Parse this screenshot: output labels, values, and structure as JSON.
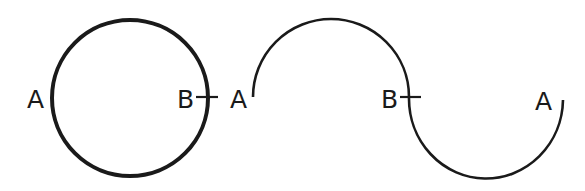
{
  "diagram": {
    "stroke_color": "#1a1a1a",
    "background": "#ffffff",
    "left_figure": {
      "shape": "circle",
      "labels": {
        "left_point": "A",
        "right_point": "B"
      },
      "tick_at": "B"
    },
    "right_figure": {
      "shape": "two joined semicircles (S-curve)",
      "labels": {
        "start_point": "A",
        "middle_point": "B",
        "end_point": "A"
      },
      "tick_at": "B"
    }
  }
}
